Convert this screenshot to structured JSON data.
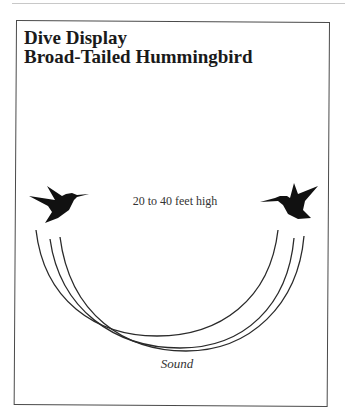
{
  "diagram": {
    "title_line1": "Dive Display",
    "title_line2": "Broad-Tailed Hummingbird",
    "height_label": "20 to 40 feet high",
    "bottom_label": "Sound",
    "icons": {
      "left_bird": "hummingbird-icon",
      "right_bird": "hummingbird-icon"
    },
    "colors": {
      "ink": "#1a1a1a",
      "frame": "#4a4a4a",
      "arc": "#2a2a2a"
    },
    "arcs": 3
  }
}
